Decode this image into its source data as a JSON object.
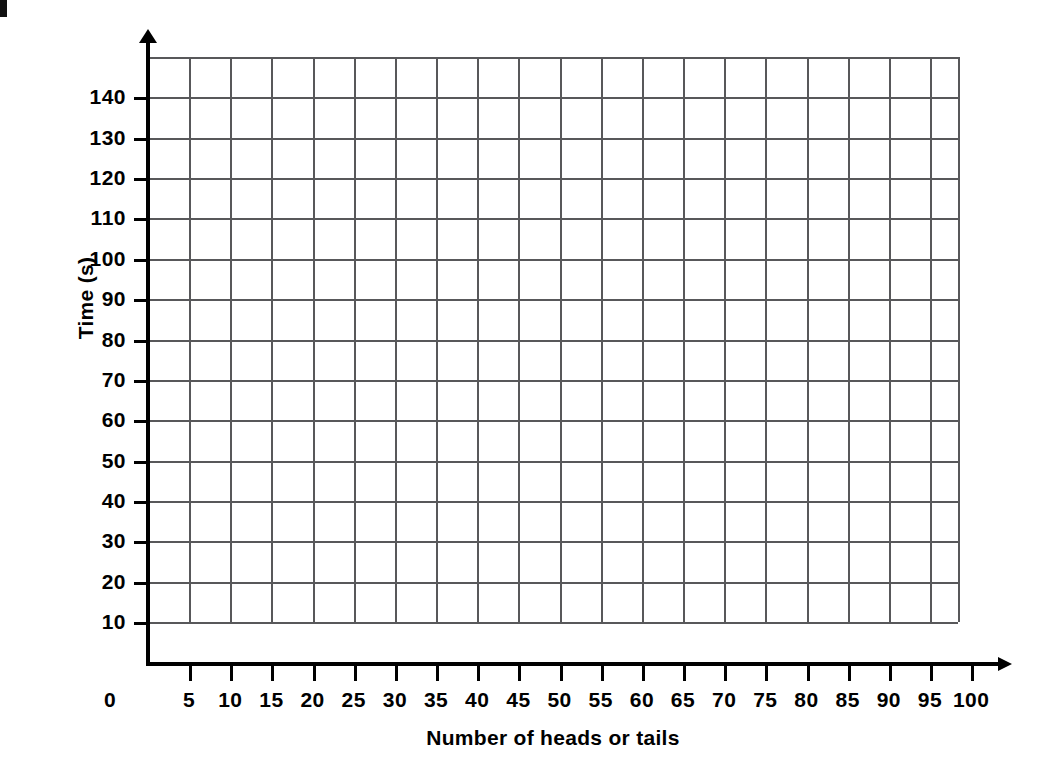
{
  "chart_data": {
    "type": "scatter",
    "title": "",
    "subtitle": "",
    "xlabel": "Number of heads or tails",
    "ylabel": "Time (s)",
    "x_tick_labels": [
      "0",
      "5",
      "10",
      "15",
      "20",
      "25",
      "30",
      "35",
      "40",
      "45",
      "50",
      "55",
      "60",
      "65",
      "70",
      "75",
      "80",
      "85",
      "90",
      "95",
      "100"
    ],
    "y_tick_labels": [
      "10",
      "20",
      "30",
      "40",
      "50",
      "60",
      "70",
      "80",
      "90",
      "100",
      "110",
      "120",
      "130",
      "140"
    ],
    "xlim": [
      0,
      100
    ],
    "ylim": [
      0,
      150
    ],
    "x_tick_step": 5,
    "y_tick_step": 10,
    "grid": true,
    "grid_x_step": 5,
    "grid_y_step": 10,
    "legend": "none",
    "series": [],
    "values": [],
    "categories": [],
    "annotations": [],
    "colors": {
      "axis": "#000000",
      "grid": "#58585a",
      "text": "#000000",
      "background": "#ffffff"
    }
  },
  "axes": {
    "y": {
      "title": "Time (s)",
      "ticks": [
        {
          "label": "10",
          "value": 10
        },
        {
          "label": "20",
          "value": 20
        },
        {
          "label": "30",
          "value": 30
        },
        {
          "label": "40",
          "value": 40
        },
        {
          "label": "50",
          "value": 50
        },
        {
          "label": "60",
          "value": 60
        },
        {
          "label": "70",
          "value": 70
        },
        {
          "label": "80",
          "value": 80
        },
        {
          "label": "90",
          "value": 90
        },
        {
          "label": "100",
          "value": 100
        },
        {
          "label": "110",
          "value": 110
        },
        {
          "label": "120",
          "value": 120
        },
        {
          "label": "130",
          "value": 130
        },
        {
          "label": "140",
          "value": 140
        }
      ]
    },
    "x": {
      "title": "Number of heads or tails",
      "origin_label": "0",
      "ticks": [
        {
          "label": "5",
          "value": 5
        },
        {
          "label": "10",
          "value": 10
        },
        {
          "label": "15",
          "value": 15
        },
        {
          "label": "20",
          "value": 20
        },
        {
          "label": "25",
          "value": 25
        },
        {
          "label": "30",
          "value": 30
        },
        {
          "label": "35",
          "value": 35
        },
        {
          "label": "40",
          "value": 40
        },
        {
          "label": "45",
          "value": 45
        },
        {
          "label": "50",
          "value": 50
        },
        {
          "label": "55",
          "value": 55
        },
        {
          "label": "60",
          "value": 60
        },
        {
          "label": "65",
          "value": 65
        },
        {
          "label": "70",
          "value": 70
        },
        {
          "label": "75",
          "value": 75
        },
        {
          "label": "80",
          "value": 80
        },
        {
          "label": "85",
          "value": 85
        },
        {
          "label": "90",
          "value": 90
        },
        {
          "label": "95",
          "value": 95
        },
        {
          "label": "100",
          "value": 100
        }
      ]
    }
  }
}
